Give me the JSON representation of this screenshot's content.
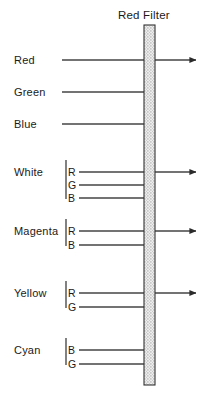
{
  "title": "Red Filter",
  "colors": {
    "ink": "#1a1a1a",
    "line": "#444444",
    "filter_outline": "#333333",
    "filter_fill": "#d9d9d9",
    "background": "#ffffff"
  },
  "filter": {
    "label": "Red Filter",
    "x": 144,
    "y": 25,
    "width": 11,
    "height": 360,
    "fill_style": "stippled"
  },
  "beams": [
    {
      "name": "red",
      "label": "Red",
      "label_x": 14,
      "label_y": 55,
      "bracket": false,
      "rays": [
        {
          "component": "R",
          "y": 60,
          "start_x": 62,
          "passes": true
        }
      ]
    },
    {
      "name": "green",
      "label": "Green",
      "label_x": 14,
      "label_y": 87,
      "bracket": false,
      "rays": [
        {
          "component": "G",
          "y": 92,
          "start_x": 62,
          "passes": false
        }
      ]
    },
    {
      "name": "blue",
      "label": "Blue",
      "label_x": 14,
      "label_y": 119,
      "bracket": false,
      "rays": [
        {
          "component": "B",
          "y": 124,
          "start_x": 62,
          "passes": false
        }
      ]
    },
    {
      "name": "white",
      "label": "White",
      "label_x": 14,
      "label_y": 167,
      "bracket": true,
      "bracket_x": 66,
      "bracket_top": 160,
      "bracket_bottom": 199,
      "rays": [
        {
          "component": "R",
          "y": 172,
          "start_x": 79,
          "passes": true
        },
        {
          "component": "G",
          "y": 185,
          "start_x": 79,
          "passes": false
        },
        {
          "component": "B",
          "y": 198,
          "start_x": 79,
          "passes": false
        }
      ]
    },
    {
      "name": "magenta",
      "label": "Magenta",
      "label_x": 14,
      "label_y": 226,
      "bracket": true,
      "bracket_x": 66,
      "bracket_top": 219,
      "bracket_bottom": 246,
      "rays": [
        {
          "component": "R",
          "y": 231,
          "start_x": 79,
          "passes": true
        },
        {
          "component": "B",
          "y": 245,
          "start_x": 79,
          "passes": false
        }
      ]
    },
    {
      "name": "yellow",
      "label": "Yellow",
      "label_x": 14,
      "label_y": 288,
      "bracket": true,
      "bracket_x": 66,
      "bracket_top": 281,
      "bracket_bottom": 308,
      "rays": [
        {
          "component": "R",
          "y": 293,
          "start_x": 79,
          "passes": true
        },
        {
          "component": "G",
          "y": 307,
          "start_x": 79,
          "passes": false
        }
      ]
    },
    {
      "name": "cyan",
      "label": "Cyan",
      "label_x": 14,
      "label_y": 345,
      "bracket": true,
      "bracket_x": 66,
      "bracket_top": 338,
      "bracket_bottom": 365,
      "rays": [
        {
          "component": "B",
          "y": 350,
          "start_x": 79,
          "passes": false
        },
        {
          "component": "G",
          "y": 364,
          "start_x": 79,
          "passes": false
        }
      ]
    }
  ],
  "geometry": {
    "arrow_end_x": 196,
    "block_x": 144,
    "canvas_width": 205,
    "canvas_height": 399
  }
}
